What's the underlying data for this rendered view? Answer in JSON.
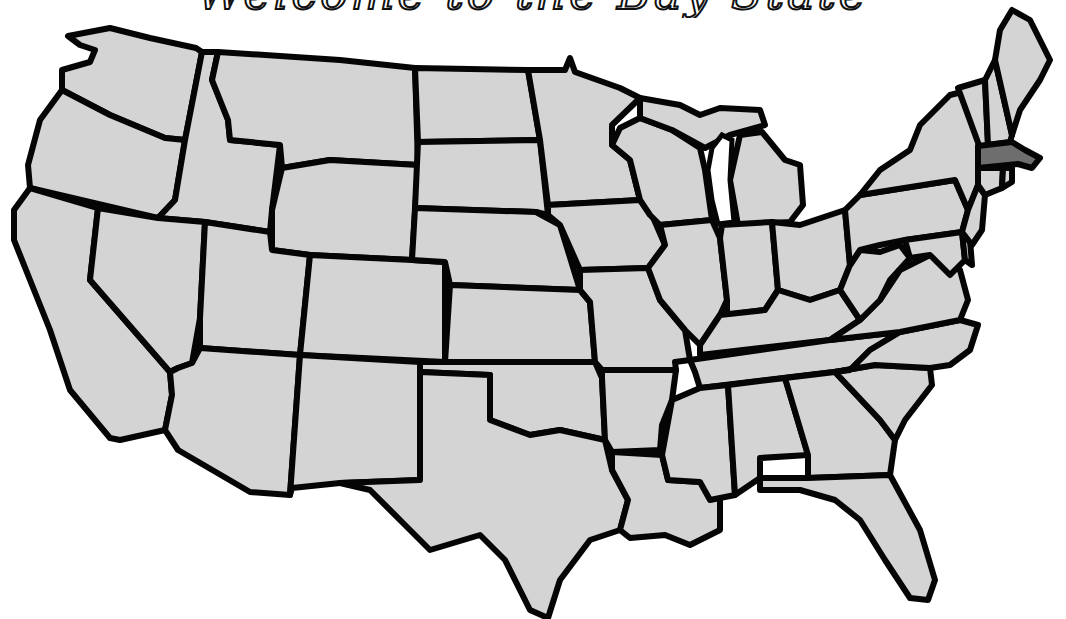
{
  "title": "Welcome to the Bay State",
  "map": {
    "type": "choropleth-outline",
    "region": "Contiguous United States",
    "colors": {
      "default_fill": "#d4d4d4",
      "highlight_fill": "#6e6e6e",
      "border": "#050505",
      "background": "#ffffff"
    },
    "highlighted_states": [
      "Massachusetts"
    ],
    "states": [
      "Washington",
      "Oregon",
      "California",
      "Idaho",
      "Nevada",
      "Montana",
      "Wyoming",
      "Utah",
      "Arizona",
      "Colorado",
      "New Mexico",
      "North Dakota",
      "South Dakota",
      "Nebraska",
      "Kansas",
      "Oklahoma",
      "Texas",
      "Minnesota",
      "Iowa",
      "Missouri",
      "Arkansas",
      "Louisiana",
      "Wisconsin",
      "Illinois",
      "Michigan",
      "Indiana",
      "Ohio",
      "Kentucky",
      "Tennessee",
      "Mississippi",
      "Alabama",
      "Georgia",
      "Florida",
      "South Carolina",
      "North Carolina",
      "Virginia",
      "West Virginia",
      "Pennsylvania",
      "New York",
      "Maryland",
      "Delaware",
      "New Jersey",
      "Connecticut",
      "Rhode Island",
      "Massachusetts",
      "Vermont",
      "New Hampshire",
      "Maine"
    ]
  }
}
